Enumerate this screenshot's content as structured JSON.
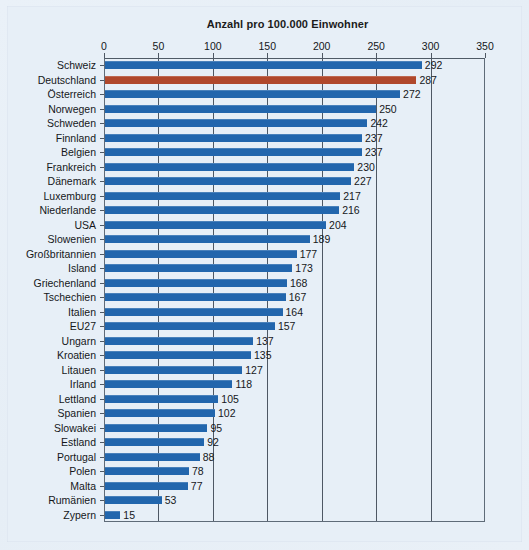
{
  "chart_data": {
    "type": "bar",
    "orientation": "horizontal",
    "title": "Anzahl pro 100.000 Einwohner",
    "xlabel": "",
    "ylabel": "",
    "xlim": [
      0,
      350
    ],
    "xticks": [
      0,
      50,
      100,
      150,
      200,
      250,
      300,
      350
    ],
    "grid": true,
    "legend": null,
    "categories": [
      "Schweiz",
      "Deutschland",
      "Österreich",
      "Norwegen",
      "Schweden",
      "Finnland",
      "Belgien",
      "Frankreich",
      "Dänemark",
      "Luxemburg",
      "Niederlande",
      "USA",
      "Slowenien",
      "Großbritannien",
      "Island",
      "Griechenland",
      "Tschechien",
      "Italien",
      "EU27",
      "Ungarn",
      "Kroatien",
      "Litauen",
      "Irland",
      "Lettland",
      "Spanien",
      "Slowakei",
      "Estland",
      "Portugal",
      "Polen",
      "Malta",
      "Rumänien",
      "Zypern"
    ],
    "values": [
      292,
      287,
      272,
      250,
      242,
      237,
      237,
      230,
      227,
      217,
      216,
      204,
      189,
      177,
      173,
      168,
      167,
      164,
      157,
      137,
      135,
      127,
      118,
      105,
      102,
      95,
      92,
      88,
      78,
      77,
      53,
      15
    ],
    "highlight_index": 1,
    "colors": {
      "bar": "#2266ad",
      "highlight": "#b0482c",
      "background": "#e7eff7",
      "grid": "#4e5864",
      "text": "#15171a"
    }
  }
}
